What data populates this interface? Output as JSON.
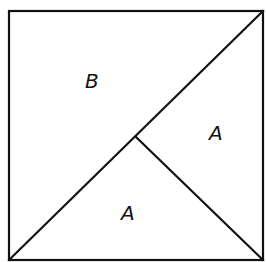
{
  "diagram": {
    "type": "square dissection",
    "square": {
      "x1": 9,
      "y1": 11,
      "x2": 263,
      "y2": 260
    },
    "diagonal": {
      "from": [
        9,
        260
      ],
      "to": [
        263,
        11
      ]
    },
    "inner_segment": {
      "from": [
        136,
        137
      ],
      "to": [
        263,
        260
      ]
    },
    "regions": [
      {
        "id": "region-b",
        "label": "B",
        "x": 95,
        "y": 88
      },
      {
        "id": "region-a-right",
        "label": "A",
        "x": 218,
        "y": 140
      },
      {
        "id": "region-a-bottom",
        "label": "A",
        "x": 130,
        "y": 220
      }
    ],
    "stroke_color": "#111111",
    "background_color": "#ffffff"
  }
}
